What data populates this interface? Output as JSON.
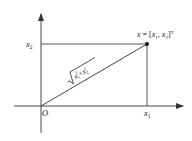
{
  "diagram": {
    "type": "vector-in-2d-coordinate-plane",
    "origin_label": "O",
    "x_axis_tick_label": {
      "base": "x",
      "sub": "1"
    },
    "y_axis_tick_label": {
      "base": "x",
      "sub": "2"
    },
    "point_label": {
      "lhs": "x",
      "eq": " = [",
      "c1": "x",
      "c1_sub": "1",
      "sep": ", ",
      "c2": "x",
      "c2_sub": "2",
      "close": "]",
      "sup": "T"
    },
    "hypotenuse_label": {
      "t1": "x",
      "t1_sub": "1",
      "t1_sup": "2",
      "plus": "+",
      "t2": "x",
      "t2_sub": "2",
      "t2_sup": "2"
    },
    "colors": {
      "line": "#333333",
      "text": "#222222",
      "point": "#111111",
      "background": "#ffffff"
    }
  }
}
